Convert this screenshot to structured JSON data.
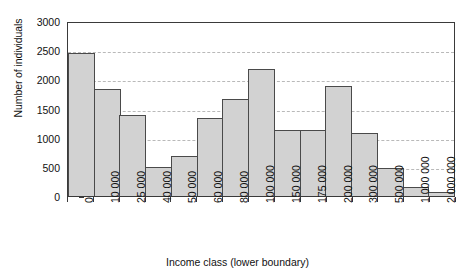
{
  "chart_data": {
    "type": "bar",
    "title": "",
    "xlabel": "Income class (lower boundary)",
    "ylabel": "Number of individuals",
    "categories": [
      "0",
      "10 000",
      "25 000",
      "40 000",
      "50 000",
      "60 000",
      "80 000",
      "100 000",
      "150 000",
      "175 000",
      "200 000",
      "300 000",
      "500 000",
      "1 000 000",
      "2 000 000"
    ],
    "values": [
      2460,
      1840,
      1390,
      490,
      680,
      1330,
      1660,
      2170,
      1130,
      1135,
      1890,
      1080,
      475,
      160,
      70
    ],
    "ylim": [
      0,
      3000
    ],
    "ytick_labels": [
      "0",
      "500",
      "1000",
      "1500",
      "2000",
      "2500",
      "3000"
    ],
    "ytick_values": [
      0,
      500,
      1000,
      1500,
      2000,
      2500,
      3000
    ],
    "grid": true,
    "legend": false,
    "bar_fill_color": "#d2d2d2",
    "bar_border_color": "#4a4a4a",
    "gridline_color": "#b9b9b9",
    "axis_color": "#3a3a3a"
  }
}
